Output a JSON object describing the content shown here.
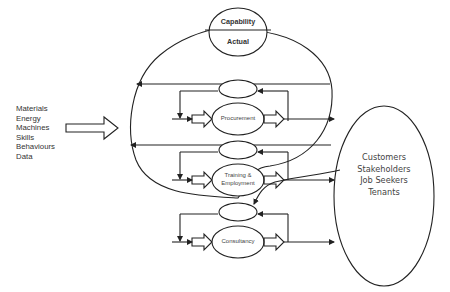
{
  "diagram": {
    "capability_node": {
      "top_label": "Capability",
      "bottom_label": "Actual"
    },
    "inputs": [
      "Materials",
      "Energy",
      "Machines",
      "Skills",
      "Behaviours",
      "Data"
    ],
    "processes": [
      {
        "label_lines": [
          "Procurement"
        ]
      },
      {
        "label_lines": [
          "Training &",
          "Employment"
        ]
      },
      {
        "label_lines": [
          "Consultancy"
        ]
      }
    ],
    "outputs": [
      "Customers",
      "Stakeholders",
      "Job Seekers",
      "Tenants"
    ],
    "colors": {
      "stroke": "#222222",
      "text": "#333333",
      "background": "#ffffff"
    }
  }
}
